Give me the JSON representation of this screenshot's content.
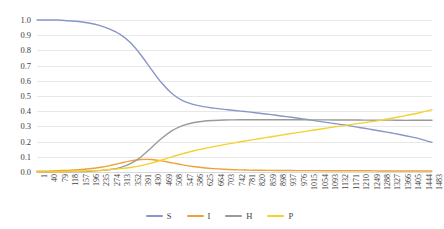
{
  "chart_data": {
    "type": "line",
    "title": "",
    "subtitle": "",
    "xlabel": "",
    "ylabel": "",
    "grid": true,
    "legend_position": "bottom",
    "xlim": [
      1,
      1483
    ],
    "ylim": [
      0.0,
      1.0
    ],
    "ytick_labels": [
      "1.0",
      "0.9",
      "0.8",
      "0.7",
      "0.6",
      "0.5",
      "0.4",
      "0.3",
      "0.2",
      "0.1",
      "0.0"
    ],
    "ytick_values": [
      1.0,
      0.9,
      0.8,
      0.7,
      0.6,
      0.5,
      0.4,
      0.3,
      0.2,
      0.1,
      0.0
    ],
    "categories": [
      1,
      40,
      79,
      118,
      157,
      196,
      235,
      274,
      313,
      352,
      391,
      430,
      469,
      508,
      547,
      586,
      625,
      664,
      703,
      742,
      781,
      820,
      859,
      898,
      937,
      976,
      1015,
      1054,
      1093,
      1132,
      1171,
      1210,
      1249,
      1288,
      1327,
      1366,
      1405,
      1444,
      1483
    ],
    "series": [
      {
        "name": "S",
        "color": "#8897c8",
        "values": [
          1.0,
          1.0,
          1.0,
          0.995,
          0.99,
          0.98,
          0.965,
          0.94,
          0.905,
          0.85,
          0.77,
          0.675,
          0.585,
          0.515,
          0.47,
          0.445,
          0.43,
          0.42,
          0.412,
          0.405,
          0.398,
          0.39,
          0.382,
          0.373,
          0.364,
          0.355,
          0.345,
          0.335,
          0.325,
          0.315,
          0.305,
          0.293,
          0.282,
          0.27,
          0.258,
          0.245,
          0.231,
          0.215,
          0.195
        ]
      },
      {
        "name": "I",
        "color": "#eda13c",
        "values": [
          0.005,
          0.006,
          0.008,
          0.011,
          0.015,
          0.021,
          0.03,
          0.042,
          0.058,
          0.073,
          0.082,
          0.082,
          0.073,
          0.06,
          0.047,
          0.036,
          0.028,
          0.022,
          0.018,
          0.015,
          0.013,
          0.012,
          0.011,
          0.01,
          0.01,
          0.009,
          0.009,
          0.009,
          0.008,
          0.008,
          0.008,
          0.008,
          0.008,
          0.007,
          0.007,
          0.007,
          0.007,
          0.007,
          0.007
        ]
      },
      {
        "name": "H",
        "color": "#9a9a9a",
        "values": [
          0.0,
          0.0,
          0.001,
          0.002,
          0.003,
          0.005,
          0.009,
          0.016,
          0.029,
          0.055,
          0.099,
          0.16,
          0.222,
          0.272,
          0.305,
          0.324,
          0.334,
          0.339,
          0.342,
          0.343,
          0.344,
          0.344,
          0.344,
          0.344,
          0.344,
          0.344,
          0.343,
          0.343,
          0.343,
          0.342,
          0.342,
          0.342,
          0.341,
          0.341,
          0.341,
          0.34,
          0.34,
          0.34,
          0.34
        ]
      },
      {
        "name": "P",
        "color": "#f5d130",
        "values": [
          0.0,
          0.001,
          0.002,
          0.003,
          0.005,
          0.008,
          0.011,
          0.016,
          0.022,
          0.03,
          0.042,
          0.058,
          0.079,
          0.1,
          0.12,
          0.138,
          0.153,
          0.167,
          0.18,
          0.192,
          0.204,
          0.215,
          0.226,
          0.237,
          0.248,
          0.259,
          0.269,
          0.28,
          0.29,
          0.3,
          0.31,
          0.32,
          0.33,
          0.34,
          0.352,
          0.365,
          0.378,
          0.393,
          0.41
        ]
      }
    ]
  },
  "legend": {
    "items": [
      {
        "label": "S",
        "color": "#8897c8"
      },
      {
        "label": "I",
        "color": "#eda13c"
      },
      {
        "label": "H",
        "color": "#9a9a9a"
      },
      {
        "label": "P",
        "color": "#f5d130"
      }
    ]
  }
}
